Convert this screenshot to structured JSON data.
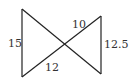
{
  "diagram": {
    "type": "bowtie-triangles",
    "vertices": {
      "top_left": [
        22,
        9
      ],
      "bottom_left": [
        22,
        77
      ],
      "top_right": [
        101,
        16
      ],
      "bottom_right": [
        101,
        74
      ],
      "center": [
        64,
        45
      ]
    },
    "labels": {
      "left_side": "15",
      "right_side": "12.5",
      "upper_right_segment": "10",
      "lower_left_segment": "12"
    },
    "colors": {
      "line": "#222222",
      "text": "#333333",
      "background": "#ffffff"
    }
  }
}
